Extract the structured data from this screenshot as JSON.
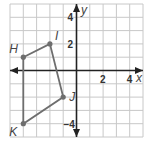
{
  "graph": {
    "x_axis_label": "x",
    "y_axis_label": "y",
    "x_ticks": [
      {
        "value": 2,
        "label": "2"
      },
      {
        "value": 4,
        "label": "4"
      }
    ],
    "y_ticks": [
      {
        "value": 4,
        "label": "4"
      },
      {
        "value": 2,
        "label": "2"
      },
      {
        "value": -4,
        "label": "−4"
      }
    ],
    "x_range": [
      -5,
      5
    ],
    "y_range": [
      -5,
      5
    ],
    "grid": true,
    "colors": {
      "grid": "#c8c8c8",
      "axis": "#222222",
      "polygon": "#6e6e6e",
      "points": "#6e6e6e"
    },
    "polygon_order": [
      "H",
      "I",
      "J",
      "K"
    ],
    "points": [
      {
        "label": "H",
        "x": -4,
        "y": 1
      },
      {
        "label": "I",
        "x": -2,
        "y": 2
      },
      {
        "label": "J",
        "x": -1,
        "y": -2
      },
      {
        "label": "K",
        "x": -4,
        "y": -4
      }
    ]
  }
}
